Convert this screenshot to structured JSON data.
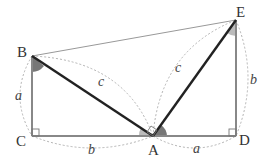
{
  "diagram": {
    "points": {
      "B": {
        "label": "B",
        "x": 32,
        "y": 56
      },
      "C": {
        "label": "C",
        "x": 32,
        "y": 136
      },
      "A": {
        "label": "A",
        "x": 153,
        "y": 136
      },
      "D": {
        "label": "D",
        "x": 236,
        "y": 136
      },
      "E": {
        "label": "E",
        "x": 236,
        "y": 20
      }
    },
    "side_labels": {
      "BC": "a",
      "CA": "b",
      "AB": "c",
      "AE": "c",
      "AD": "a",
      "DE": "b"
    },
    "colors": {
      "thin_line": "#999999",
      "thick_line": "#222222",
      "angle_dark": "#777777",
      "angle_light": "#bbbbbb",
      "dashed_arc": "#aaaaaa"
    }
  }
}
